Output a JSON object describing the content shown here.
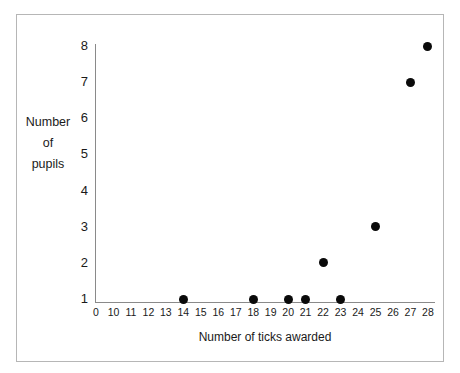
{
  "chart_data": {
    "type": "scatter",
    "title": "",
    "xlabel": "Number of ticks awarded",
    "ylabel": "Number of pupils",
    "ylabel_lines": [
      "Number",
      "of",
      "pupils"
    ],
    "x_tick_labels": [
      "0",
      "10",
      "11",
      "12",
      "13",
      "14",
      "15",
      "16",
      "17",
      "18",
      "19",
      "20",
      "21",
      "22",
      "23",
      "24",
      "25",
      "26",
      "27",
      "28"
    ],
    "y_tick_labels": [
      "1",
      "2",
      "3",
      "4",
      "5",
      "6",
      "7",
      "8"
    ],
    "xlim": [
      0,
      28
    ],
    "ylim": [
      1,
      8
    ],
    "grid": false,
    "legend": null,
    "marker": {
      "shape": "circle",
      "color": "#0a0a0a",
      "size_px": 9
    },
    "points": [
      {
        "x": 14,
        "y": 1
      },
      {
        "x": 18,
        "y": 1
      },
      {
        "x": 20,
        "y": 1
      },
      {
        "x": 21,
        "y": 1
      },
      {
        "x": 23,
        "y": 1
      },
      {
        "x": 22,
        "y": 2
      },
      {
        "x": 25,
        "y": 3
      },
      {
        "x": 27,
        "y": 7
      },
      {
        "x": 28,
        "y": 8
      }
    ],
    "axis_color": "#8a8a8a",
    "frame_color": "#b6b6b6",
    "background": "#ffffff"
  },
  "geometry": {
    "x_tick_start_px": 96,
    "x_tick_step_px": 17.47,
    "y_bottom_px": 299,
    "y_unit_px": 36.14,
    "plot_left_px": 95,
    "plot_bottom_px": 302
  }
}
